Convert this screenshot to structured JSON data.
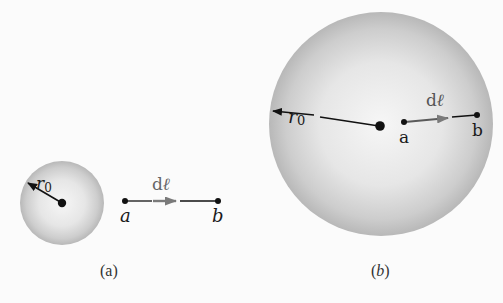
{
  "panels": [
    {
      "id": "a",
      "caption": "(a)",
      "radius_label": "r",
      "radius_subscript": "0",
      "vector_label": "d",
      "vector_ell": "ℓ",
      "point_a": "a",
      "point_b": "b",
      "description": "Small sphere of radius r0; points a and b lie outside the sphere"
    },
    {
      "id": "b",
      "caption": "(b)",
      "radius_label": "r",
      "radius_subscript": "0",
      "vector_label": "d",
      "vector_ell": "ℓ",
      "point_a": "a",
      "point_b": "b",
      "description": "Large sphere of radius r0; points a and b lie inside the sphere"
    }
  ],
  "colors": {
    "background": "#fbfbfb",
    "sphere_center": "#f4f4f4",
    "sphere_edge": "#b5b5b5",
    "ink": "#111111",
    "vector_arrow": "#7a7a7a"
  }
}
